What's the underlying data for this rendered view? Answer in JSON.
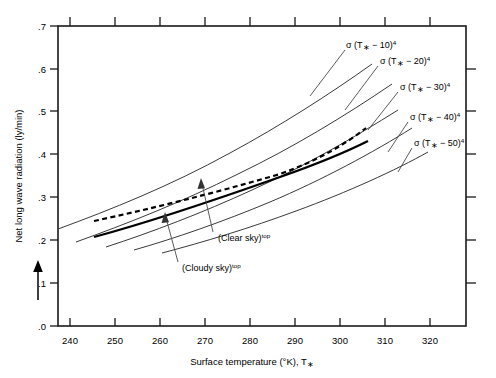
{
  "chart_data": {
    "type": "line",
    "title": "",
    "xlabel": "Surface temperature (°K), T∗",
    "ylabel": "Net long wave radiation (ly/min)",
    "xlim": [
      235,
      325
    ],
    "ylim": [
      0.0,
      0.7
    ],
    "grid": false,
    "legend_position": "inline-right-of-curves",
    "x_ticks": [
      240,
      250,
      260,
      270,
      280,
      290,
      300,
      310,
      320
    ],
    "y_ticks": [
      ".0",
      ".1",
      ".2",
      ".3",
      ".4",
      ".5",
      ".6",
      ".7"
    ],
    "y_tick_values": [
      0.0,
      0.1,
      0.2,
      0.3,
      0.4,
      0.5,
      0.6,
      0.7
    ],
    "series": [
      {
        "name": "σ (T∗ − 10)⁴",
        "style": "thin-solid",
        "label": "sigma-T-minus-10",
        "x": [
          240,
          250,
          260,
          270,
          280,
          290,
          300,
          310,
          318
        ],
        "y": [
          0.225,
          0.262,
          0.303,
          0.348,
          0.397,
          0.452,
          0.511,
          0.575,
          0.63
        ]
      },
      {
        "name": "σ (T∗ − 20)⁴",
        "style": "thin-solid",
        "label": "sigma-T-minus-20",
        "x": [
          244,
          250,
          260,
          270,
          280,
          290,
          300,
          310,
          318
        ],
        "y": [
          0.196,
          0.222,
          0.258,
          0.298,
          0.341,
          0.39,
          0.443,
          0.5,
          0.55
        ]
      },
      {
        "name": "σ (T∗ − 30)⁴",
        "style": "thin-solid",
        "label": "sigma-T-minus-30",
        "x": [
          251,
          260,
          270,
          280,
          290,
          300,
          310,
          318
        ],
        "y": [
          0.185,
          0.218,
          0.253,
          0.292,
          0.335,
          0.382,
          0.433,
          0.477
        ]
      },
      {
        "name": "σ (T∗ − 40)⁴",
        "style": "thin-solid",
        "label": "sigma-T-minus-40",
        "x": [
          257,
          265,
          275,
          285,
          295,
          305,
          315,
          320
        ],
        "y": [
          0.177,
          0.201,
          0.233,
          0.268,
          0.307,
          0.35,
          0.396,
          0.42
        ]
      },
      {
        "name": "σ (T∗ − 50)⁴",
        "style": "thin-solid",
        "label": "sigma-T-minus-50",
        "x": [
          263,
          272,
          282,
          292,
          302,
          312,
          320
        ],
        "y": [
          0.171,
          0.196,
          0.226,
          0.259,
          0.296,
          0.336,
          0.371
        ]
      },
      {
        "name": "(Cloudy sky)ᵗᵒᵖ",
        "style": "bold-solid",
        "label": "cloudy-sky-line",
        "x": [
          248,
          265,
          280,
          295,
          310,
          318
        ],
        "y": [
          0.208,
          0.248,
          0.288,
          0.33,
          0.378,
          0.403
        ]
      },
      {
        "name": "(Clear sky)ᵗᵒᵖ",
        "style": "bold-dashed",
        "label": "clear-sky-line",
        "x": [
          248,
          265,
          280,
          295,
          310,
          318
        ],
        "y": [
          0.244,
          0.276,
          0.307,
          0.343,
          0.386,
          0.412
        ]
      }
    ],
    "annotations": [
      {
        "text": "(Clear sky)",
        "superscript": "top",
        "name": "clear-sky-annotation"
      },
      {
        "text": "(Cloudy  sky)",
        "superscript": "top",
        "name": "cloudy-sky-annotation"
      }
    ],
    "curve_labels": [
      {
        "base": "σ (T",
        "star": "∗",
        "minus": " − 10)",
        "exp": "4",
        "name": "sigma-T-minus-10-label"
      },
      {
        "base": "σ (T",
        "star": "∗",
        "minus": " − 20)",
        "exp": "4",
        "name": "sigma-T-minus-20-label"
      },
      {
        "base": "σ (T",
        "star": "∗",
        "minus": " − 30)",
        "exp": "4",
        "name": "sigma-T-minus-30-label"
      },
      {
        "base": "σ (T",
        "star": "∗",
        "minus": " − 40)",
        "exp": "4",
        "name": "sigma-T-minus-40-label"
      },
      {
        "base": "σ (T",
        "star": "∗",
        "minus": " − 50)",
        "exp": "4",
        "name": "sigma-T-minus-50-label"
      }
    ],
    "colors": {
      "frame": "#1a1a1a",
      "thin_curve": "#3a3a3a",
      "bold_curve": "#000000",
      "leader": "#4a4a4a",
      "background": "#ffffff"
    }
  },
  "axis": {
    "x_title": "Surface temperature (°K), T∗",
    "x_title_main": "Surface temperature (°K), T",
    "x_title_star": "∗",
    "y_title": "Net long wave radiation (ly/min)",
    "x_tick_labels": [
      "240",
      "250",
      "260",
      "270",
      "280",
      "290",
      "300",
      "310",
      "320"
    ],
    "y_tick_labels": [
      ".0",
      ".1",
      ".2",
      ".3",
      ".4",
      ".5",
      ".6",
      ".7"
    ]
  },
  "annotation_text": {
    "clear_sky": "(Clear sky)",
    "clear_sky_sup": "top",
    "cloudy_sky": "(Cloudy  sky)",
    "cloudy_sky_sup": "top"
  },
  "curve_text": {
    "c10_a": "σ (T",
    "c10_star": "∗",
    "c10_b": " − 10)",
    "c10_exp": "4",
    "c20_a": "σ (T",
    "c20_star": "∗",
    "c20_b": " − 20)",
    "c20_exp": "4",
    "c30_a": "σ (T",
    "c30_star": "∗",
    "c30_b": " − 30)",
    "c30_exp": "4",
    "c40_a": "σ (T",
    "c40_star": "∗",
    "c40_b": " − 40)",
    "c40_exp": "4",
    "c50_a": "σ (T",
    "c50_star": "∗",
    "c50_b": " − 50)",
    "c50_exp": "4"
  }
}
